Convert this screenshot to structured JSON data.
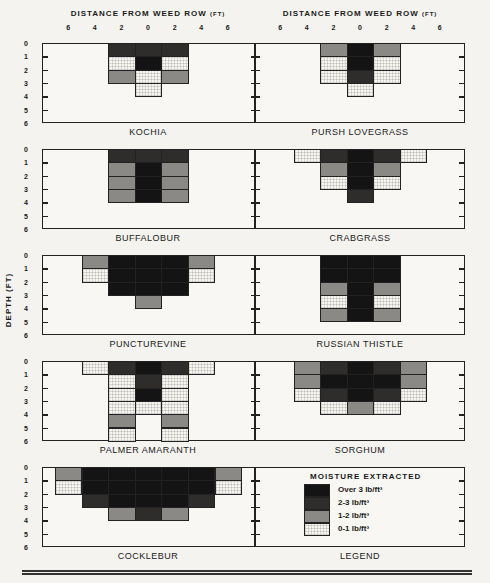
{
  "chart_data": {
    "type": "heatmap",
    "xlabel": "DISTANCE FROM WEED ROW (FT)",
    "ylabel": "DEPTH (FT)",
    "x_ticks": [
      "6",
      "4",
      "2",
      "0",
      "2",
      "4",
      "6"
    ],
    "y_ticks": [
      "0",
      "1",
      "2",
      "3",
      "4",
      "5",
      "6"
    ],
    "cell_width_ft": 2,
    "cell_height_ft": 1,
    "column_centers_ft": [
      -6,
      -4,
      -2,
      0,
      2,
      4,
      6
    ],
    "levels": [
      "0-1 lb/ft³",
      "1-2 lb/ft³",
      "2-3 lb/ft³",
      "Over 3 lb/ft³"
    ],
    "legend_title": "MOISTURE EXTRACTED",
    "panels": [
      {
        "name": "KOCHIA",
        "cells": [
          {
            "x": -2,
            "d": 0,
            "lvl": 2
          },
          {
            "x": 0,
            "d": 0,
            "lvl": 2
          },
          {
            "x": 2,
            "d": 0,
            "lvl": 2
          },
          {
            "x": -2,
            "d": 1,
            "lvl": 0
          },
          {
            "x": 0,
            "d": 1,
            "lvl": 3
          },
          {
            "x": 2,
            "d": 1,
            "lvl": 0
          },
          {
            "x": -2,
            "d": 2,
            "lvl": 1
          },
          {
            "x": 0,
            "d": 2,
            "lvl": 0
          },
          {
            "x": 2,
            "d": 2,
            "lvl": 1
          },
          {
            "x": 0,
            "d": 3,
            "lvl": 0
          }
        ]
      },
      {
        "name": "PURSH LOVEGRASS",
        "cells": [
          {
            "x": -2,
            "d": 0,
            "lvl": 1
          },
          {
            "x": 0,
            "d": 0,
            "lvl": 3
          },
          {
            "x": 2,
            "d": 0,
            "lvl": 1
          },
          {
            "x": -2,
            "d": 1,
            "lvl": 0
          },
          {
            "x": 0,
            "d": 1,
            "lvl": 3
          },
          {
            "x": 2,
            "d": 1,
            "lvl": 0
          },
          {
            "x": -2,
            "d": 2,
            "lvl": 0
          },
          {
            "x": 0,
            "d": 2,
            "lvl": 2
          },
          {
            "x": 2,
            "d": 2,
            "lvl": 0
          },
          {
            "x": 0,
            "d": 3,
            "lvl": 0
          }
        ]
      },
      {
        "name": "BUFFALOBUR",
        "cells": [
          {
            "x": -2,
            "d": 0,
            "lvl": 2
          },
          {
            "x": 0,
            "d": 0,
            "lvl": 2
          },
          {
            "x": 2,
            "d": 0,
            "lvl": 2
          },
          {
            "x": -2,
            "d": 1,
            "lvl": 1
          },
          {
            "x": 0,
            "d": 1,
            "lvl": 3
          },
          {
            "x": 2,
            "d": 1,
            "lvl": 1
          },
          {
            "x": -2,
            "d": 2,
            "lvl": 1
          },
          {
            "x": 0,
            "d": 2,
            "lvl": 3
          },
          {
            "x": 2,
            "d": 2,
            "lvl": 1
          },
          {
            "x": -2,
            "d": 3,
            "lvl": 1
          },
          {
            "x": 0,
            "d": 3,
            "lvl": 3
          },
          {
            "x": 2,
            "d": 3,
            "lvl": 1
          }
        ]
      },
      {
        "name": "CRABGRASS",
        "cells": [
          {
            "x": -4,
            "d": 0,
            "lvl": 0
          },
          {
            "x": -2,
            "d": 0,
            "lvl": 2
          },
          {
            "x": 0,
            "d": 0,
            "lvl": 3
          },
          {
            "x": 2,
            "d": 0,
            "lvl": 2
          },
          {
            "x": 4,
            "d": 0,
            "lvl": 0
          },
          {
            "x": -2,
            "d": 1,
            "lvl": 1
          },
          {
            "x": 0,
            "d": 1,
            "lvl": 3
          },
          {
            "x": 2,
            "d": 1,
            "lvl": 1
          },
          {
            "x": -2,
            "d": 2,
            "lvl": 0
          },
          {
            "x": 0,
            "d": 2,
            "lvl": 3
          },
          {
            "x": 2,
            "d": 2,
            "lvl": 0
          },
          {
            "x": 0,
            "d": 3,
            "lvl": 2
          }
        ]
      },
      {
        "name": "PUNCTUREVINE",
        "cells": [
          {
            "x": -4,
            "d": 0,
            "lvl": 1
          },
          {
            "x": -2,
            "d": 0,
            "lvl": 3
          },
          {
            "x": 0,
            "d": 0,
            "lvl": 3
          },
          {
            "x": 2,
            "d": 0,
            "lvl": 3
          },
          {
            "x": 4,
            "d": 0,
            "lvl": 1
          },
          {
            "x": -4,
            "d": 1,
            "lvl": 0
          },
          {
            "x": -2,
            "d": 1,
            "lvl": 3
          },
          {
            "x": 0,
            "d": 1,
            "lvl": 3
          },
          {
            "x": 2,
            "d": 1,
            "lvl": 3
          },
          {
            "x": 4,
            "d": 1,
            "lvl": 0
          },
          {
            "x": -2,
            "d": 2,
            "lvl": 3
          },
          {
            "x": 0,
            "d": 2,
            "lvl": 3
          },
          {
            "x": 2,
            "d": 2,
            "lvl": 3
          },
          {
            "x": 0,
            "d": 3,
            "lvl": 1
          }
        ]
      },
      {
        "name": "RUSSIAN THISTLE",
        "cells": [
          {
            "x": -2,
            "d": 0,
            "lvl": 3
          },
          {
            "x": 0,
            "d": 0,
            "lvl": 3
          },
          {
            "x": 2,
            "d": 0,
            "lvl": 3
          },
          {
            "x": -2,
            "d": 1,
            "lvl": 3
          },
          {
            "x": 0,
            "d": 1,
            "lvl": 3
          },
          {
            "x": 2,
            "d": 1,
            "lvl": 3
          },
          {
            "x": -2,
            "d": 2,
            "lvl": 1
          },
          {
            "x": 0,
            "d": 2,
            "lvl": 3
          },
          {
            "x": 2,
            "d": 2,
            "lvl": 1
          },
          {
            "x": -2,
            "d": 3,
            "lvl": 0
          },
          {
            "x": 0,
            "d": 3,
            "lvl": 3
          },
          {
            "x": 2,
            "d": 3,
            "lvl": 0
          },
          {
            "x": -2,
            "d": 4,
            "lvl": 1
          },
          {
            "x": 0,
            "d": 4,
            "lvl": 3
          },
          {
            "x": 2,
            "d": 4,
            "lvl": 1
          }
        ]
      },
      {
        "name": "PALMER AMARANTH",
        "cells": [
          {
            "x": -4,
            "d": 0,
            "lvl": 0
          },
          {
            "x": -2,
            "d": 0,
            "lvl": 2
          },
          {
            "x": 0,
            "d": 0,
            "lvl": 3
          },
          {
            "x": 2,
            "d": 0,
            "lvl": 2
          },
          {
            "x": 4,
            "d": 0,
            "lvl": 0
          },
          {
            "x": -2,
            "d": 1,
            "lvl": 0
          },
          {
            "x": 0,
            "d": 1,
            "lvl": 2
          },
          {
            "x": 2,
            "d": 1,
            "lvl": 0
          },
          {
            "x": -2,
            "d": 2,
            "lvl": 0
          },
          {
            "x": 0,
            "d": 2,
            "lvl": 3
          },
          {
            "x": 2,
            "d": 2,
            "lvl": 0
          },
          {
            "x": -2,
            "d": 3,
            "lvl": 0
          },
          {
            "x": 0,
            "d": 3,
            "lvl": 0
          },
          {
            "x": 2,
            "d": 3,
            "lvl": 0
          },
          {
            "x": -2,
            "d": 4,
            "lvl": 1
          },
          {
            "x": 2,
            "d": 4,
            "lvl": 1
          },
          {
            "x": -2,
            "d": 5,
            "lvl": 0
          },
          {
            "x": 2,
            "d": 5,
            "lvl": 0
          }
        ]
      },
      {
        "name": "SORGHUM",
        "cells": [
          {
            "x": -4,
            "d": 0,
            "lvl": 1
          },
          {
            "x": -2,
            "d": 0,
            "lvl": 2
          },
          {
            "x": 0,
            "d": 0,
            "lvl": 3
          },
          {
            "x": 2,
            "d": 0,
            "lvl": 2
          },
          {
            "x": 4,
            "d": 0,
            "lvl": 1
          },
          {
            "x": -4,
            "d": 1,
            "lvl": 1
          },
          {
            "x": -2,
            "d": 1,
            "lvl": 3
          },
          {
            "x": 0,
            "d": 1,
            "lvl": 3
          },
          {
            "x": 2,
            "d": 1,
            "lvl": 3
          },
          {
            "x": 4,
            "d": 1,
            "lvl": 1
          },
          {
            "x": -4,
            "d": 2,
            "lvl": 0
          },
          {
            "x": -2,
            "d": 2,
            "lvl": 2
          },
          {
            "x": 0,
            "d": 2,
            "lvl": 3
          },
          {
            "x": 2,
            "d": 2,
            "lvl": 2
          },
          {
            "x": 4,
            "d": 2,
            "lvl": 0
          },
          {
            "x": -2,
            "d": 3,
            "lvl": 0
          },
          {
            "x": 0,
            "d": 3,
            "lvl": 1
          },
          {
            "x": 2,
            "d": 3,
            "lvl": 0
          }
        ]
      },
      {
        "name": "COCKLEBUR",
        "cells": [
          {
            "x": -6,
            "d": 0,
            "lvl": 1
          },
          {
            "x": -4,
            "d": 0,
            "lvl": 3
          },
          {
            "x": -2,
            "d": 0,
            "lvl": 3
          },
          {
            "x": 0,
            "d": 0,
            "lvl": 3
          },
          {
            "x": 2,
            "d": 0,
            "lvl": 3
          },
          {
            "x": 4,
            "d": 0,
            "lvl": 3
          },
          {
            "x": 6,
            "d": 0,
            "lvl": 1
          },
          {
            "x": -6,
            "d": 1,
            "lvl": 0
          },
          {
            "x": -4,
            "d": 1,
            "lvl": 3
          },
          {
            "x": -2,
            "d": 1,
            "lvl": 3
          },
          {
            "x": 0,
            "d": 1,
            "lvl": 3
          },
          {
            "x": 2,
            "d": 1,
            "lvl": 3
          },
          {
            "x": 4,
            "d": 1,
            "lvl": 3
          },
          {
            "x": 6,
            "d": 1,
            "lvl": 0
          },
          {
            "x": -4,
            "d": 2,
            "lvl": 2
          },
          {
            "x": -2,
            "d": 2,
            "lvl": 3
          },
          {
            "x": 0,
            "d": 2,
            "lvl": 3
          },
          {
            "x": 2,
            "d": 2,
            "lvl": 3
          },
          {
            "x": 4,
            "d": 2,
            "lvl": 2
          },
          {
            "x": -2,
            "d": 3,
            "lvl": 1
          },
          {
            "x": 0,
            "d": 3,
            "lvl": 2
          },
          {
            "x": 2,
            "d": 3,
            "lvl": 1
          }
        ]
      }
    ]
  },
  "header": {
    "left_axis_title": "DISTANCE FROM WEED ROW",
    "right_axis_title": "DISTANCE FROM WEED ROW",
    "unit": "(FT)",
    "depth_label": "DEPTH (FT)"
  },
  "labels": {
    "kochia": "KOCHIA",
    "pursh": "PURSH LOVEGRASS",
    "buffalobur": "BUFFALOBUR",
    "crabgrass": "CRABGRASS",
    "puncturevine": "PUNCTUREVINE",
    "russian": "RUSSIAN THISTLE",
    "palmer": "PALMER AMARANTH",
    "sorghum": "SORGHUM",
    "cocklebur": "COCKLEBUR",
    "legend": "LEGEND"
  },
  "legend": {
    "title": "MOISTURE EXTRACTED",
    "items": [
      {
        "label": "Over 3 lb/ft³",
        "color": "#141414"
      },
      {
        "label": "2-3 lb/ft³",
        "color": "#2e2d2c"
      },
      {
        "label": "1-2 lb/ft³",
        "color": "#8a8986"
      },
      {
        "label": "0-1 lb/ft³",
        "color": "#f6f5f0"
      }
    ]
  },
  "ticks": {
    "x": [
      "6",
      "4",
      "2",
      "0",
      "2",
      "4",
      "6"
    ],
    "y": [
      "0",
      "1",
      "2",
      "3",
      "4",
      "5",
      "6"
    ]
  }
}
